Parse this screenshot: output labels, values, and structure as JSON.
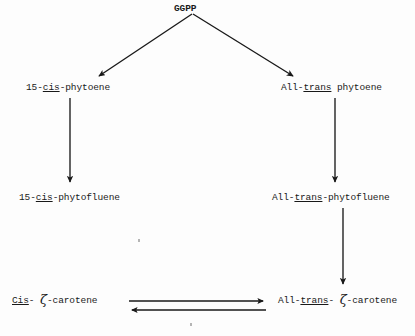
{
  "figure": {
    "type": "pathway-diagram",
    "background_color": "#fdfdfd",
    "ink_color": "#191919"
  },
  "nodes": {
    "ggpp": {
      "id": "ggpp",
      "label": "GGPP",
      "x": 174,
      "y": 3,
      "style": "bold"
    },
    "cis_phytoene": {
      "id": "cis-phytoene",
      "prefix": "15-",
      "underlined": "cis",
      "suffix": "-phytoene",
      "full_label": "15-cis-phytoene",
      "x": 26,
      "y": 82
    },
    "trans_phytoene": {
      "id": "trans-phytoene",
      "prefix": "All-",
      "underlined": "trans",
      "suffix": " phytoene",
      "full_label": "All-trans phytoene",
      "x": 281,
      "y": 82
    },
    "cis_phytofluene": {
      "id": "cis-phytofluene",
      "prefix": "15-",
      "underlined": "cis",
      "suffix": "-phytofluene",
      "full_label": "15-cis-phytofluene",
      "x": 19,
      "y": 192
    },
    "trans_phytofluene": {
      "id": "trans-phytofluene",
      "prefix": "All-",
      "underlined": "trans",
      "suffix": "-phytofluene",
      "full_label": "All-trans-phytofluene",
      "x": 272,
      "y": 192
    },
    "cis_zeta_carotene": {
      "id": "cis-zeta-carotene",
      "prefix": "",
      "underlined": "Cis",
      "mid": "- ",
      "greek": "ζ",
      "suffix": "-carotene",
      "full_label": "Cis- ζ-carotene",
      "x": 12,
      "y": 294
    },
    "trans_zeta_carotene": {
      "id": "trans-zeta-carotene",
      "prefix": "All-",
      "underlined": "trans",
      "mid": "- ",
      "greek": "ζ",
      "suffix": "-carotene",
      "full_label": "All-trans- ζ-carotene",
      "x": 278,
      "y": 294
    }
  },
  "edges": [
    {
      "id": "ggpp-to-cis-phytoene",
      "from": "ggpp",
      "to": "cis_phytoene",
      "kind": "arrow",
      "direction": "down-left",
      "x1": 192,
      "y1": 14,
      "x2": 96,
      "y2": 78
    },
    {
      "id": "ggpp-to-trans-phytoene",
      "from": "ggpp",
      "to": "trans_phytoene",
      "kind": "arrow",
      "direction": "down-right",
      "x1": 193,
      "y1": 14,
      "x2": 296,
      "y2": 79
    },
    {
      "id": "cis-phytoene-to-cis-phytofluene",
      "from": "cis_phytoene",
      "to": "cis_phytofluene",
      "kind": "arrow",
      "direction": "down",
      "x1": 70,
      "y1": 98,
      "x2": 70,
      "y2": 186
    },
    {
      "id": "trans-phytoene-to-trans-phytofluene",
      "from": "trans_phytoene",
      "to": "trans_phytofluene",
      "kind": "arrow",
      "direction": "down",
      "x1": 335,
      "y1": 98,
      "x2": 335,
      "y2": 186
    },
    {
      "id": "trans-phytofluene-to-trans-zeta-carotene",
      "from": "trans_phytofluene",
      "to": "trans_zeta_carotene",
      "kind": "arrow",
      "direction": "down",
      "x1": 343,
      "y1": 208,
      "x2": 343,
      "y2": 288
    },
    {
      "id": "cis-to-trans-zeta-carotene",
      "from": "cis_zeta_carotene",
      "to": "trans_zeta_carotene",
      "kind": "arrow",
      "direction": "right",
      "x1": 129,
      "y1": 301,
      "x2": 268,
      "y2": 301
    },
    {
      "id": "trans-to-cis-zeta-carotene",
      "from": "trans_zeta_carotene",
      "to": "cis_zeta_carotene",
      "kind": "arrow",
      "direction": "left",
      "x1": 266,
      "y1": 310,
      "x2": 127,
      "y2": 310
    }
  ],
  "artifacts": [
    {
      "id": "scan-speck-1",
      "x": 138,
      "y": 239
    },
    {
      "id": "scan-speck-2",
      "x": 190,
      "y": 323
    }
  ]
}
